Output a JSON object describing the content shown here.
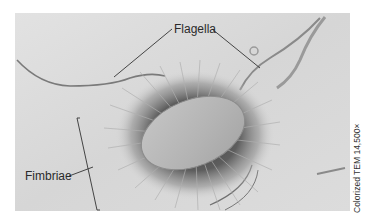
{
  "figure": {
    "labels": {
      "flagella": "Flagella",
      "fimbriae": "Fimbriae"
    },
    "credit": "Colorized TEM 14,500×"
  },
  "colors": {
    "background": "#ffffff",
    "photo_bg": "#d9d9d9",
    "cell_body": "#b8b8b8",
    "halo": "#6a6a6a",
    "leader_line": "#333333"
  }
}
